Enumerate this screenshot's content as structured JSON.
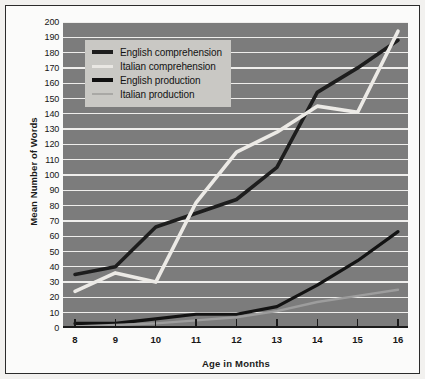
{
  "figure": {
    "border_color": "#2b2b2b",
    "page_background": "#fbfbfa",
    "outer_background": "#f2f1ef"
  },
  "chart_data": {
    "type": "line",
    "title": "",
    "xlabel": "Age in Months",
    "ylabel": "Mean Number of Words",
    "x": [
      8,
      9,
      10,
      11,
      12,
      13,
      14,
      15,
      16
    ],
    "xlim": [
      8,
      16
    ],
    "ylim": [
      0,
      200
    ],
    "ytick_step": 10,
    "yticks": [
      200,
      190,
      180,
      170,
      160,
      150,
      140,
      130,
      120,
      110,
      100,
      90,
      80,
      70,
      60,
      50,
      40,
      30,
      20,
      10,
      0
    ],
    "xticks": [
      "8",
      "9",
      "10",
      "11",
      "12",
      "13",
      "14",
      "15",
      "16"
    ],
    "grid": "horizontal",
    "plot_background": "#7c7c7c",
    "gridline_color": "#efeeec",
    "legend_position": "upper-left",
    "series": [
      {
        "name": "English comprehension",
        "color": "#1d1d1d",
        "width": 3.6,
        "values": [
          35,
          40,
          66,
          75,
          84,
          105,
          154,
          170,
          188
        ]
      },
      {
        "name": "Italian comprehension",
        "color": "#eceae6",
        "width": 3.6,
        "values": [
          24,
          36,
          30,
          82,
          115,
          128,
          145,
          141,
          194
        ]
      },
      {
        "name": "English production",
        "color": "#131313",
        "width": 3.2,
        "values": [
          3,
          3,
          6,
          9,
          9,
          14,
          28,
          44,
          63
        ]
      },
      {
        "name": "Italian production",
        "color": "#9d9d9d",
        "width": 2.4,
        "values": [
          1,
          2,
          3,
          5,
          7,
          11,
          17,
          21,
          25
        ]
      }
    ]
  },
  "legend": {
    "background": "#c9c8c4",
    "items": [
      {
        "label": "English comprehension",
        "color": "#1d1d1d",
        "width": 3.8
      },
      {
        "label": "Italian comprehension",
        "color": "#e9e7e3",
        "width": 3.0
      },
      {
        "label": "English production",
        "color": "#101010",
        "width": 4.0
      },
      {
        "label": "Italian production",
        "color": "#a9a8a5",
        "width": 2.6
      }
    ]
  }
}
